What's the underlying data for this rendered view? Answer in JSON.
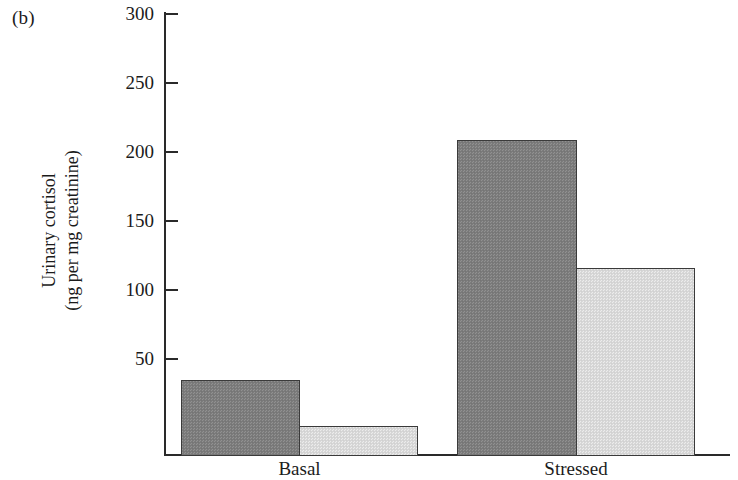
{
  "figure": {
    "panel_label": "(b)",
    "background_color": "#ffffff",
    "axis_color": "#2a2a2a"
  },
  "axis": {
    "ylabel_line1": "Urinary cortisol",
    "ylabel_line2": "(ng per mg creatinine)",
    "tick_labels": [
      "300",
      "250",
      "200",
      "150",
      "100",
      "50"
    ],
    "category_labels": [
      "Basal",
      "Stressed"
    ]
  },
  "chart_data": {
    "type": "bar",
    "title": "",
    "subtitle": "",
    "panel": "(b)",
    "xlabel": "",
    "ylabel": "Urinary cortisol (ng per mg creatinine)",
    "categories": [
      "Basal",
      "Stressed"
    ],
    "series": [
      {
        "name": "dark",
        "color": "#7d7d7d",
        "values": [
          51,
          214
        ]
      },
      {
        "name": "light",
        "color": "#d9d9d9",
        "values": [
          20,
          127
        ]
      }
    ],
    "ylim": [
      0,
      300
    ],
    "yticks": [
      50,
      100,
      150,
      200,
      250,
      300
    ],
    "grid": false,
    "legend": "none",
    "bar_gap_between_series": 0
  }
}
